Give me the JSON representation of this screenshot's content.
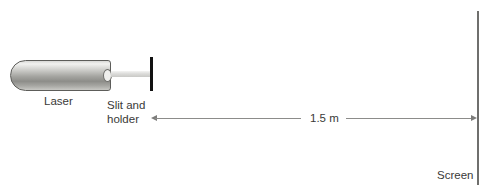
{
  "diagram": {
    "background_color": "#ffffff",
    "text_color": "#3a3a38"
  },
  "apparatus": {
    "laser": {
      "label": "Laser",
      "icon": "laser-cylinder",
      "color_light": "#f2f2f0",
      "color_dark": "#8d8d89"
    },
    "aperture": {
      "icon": "laser-aperture"
    },
    "beam": {
      "icon": "laser-beam",
      "color": "#dcdcda"
    },
    "slit": {
      "label_line1": "Slit and",
      "label_line2": "holder",
      "icon": "slit-bar",
      "color": "#111111"
    },
    "screen": {
      "label": "Screen",
      "icon": "screen-line",
      "color": "#6f6f6d"
    }
  },
  "dimension": {
    "value": "1.5 m",
    "line_color": "#8c8c8a",
    "arrow_color": "#7d7d7b"
  }
}
